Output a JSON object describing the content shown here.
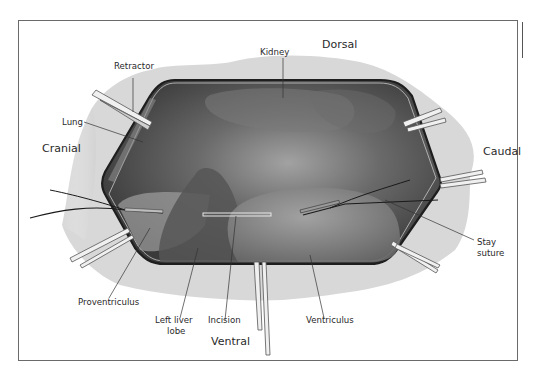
{
  "figure": {
    "type": "surgical-anatomy-diagram",
    "orientation": {
      "top": "Dorsal",
      "bottom": "Ventral",
      "left": "Cranial",
      "right": "Caudal"
    },
    "labels": {
      "retractor": "Retractor",
      "kidney": "Kidney",
      "lung": "Lung",
      "stay_suture_line1": "Stay",
      "stay_suture_line2": "suture",
      "proventriculus": "Proventriculus",
      "left_liver_lobe_line1": "Left liver",
      "left_liver_lobe_line2": "lobe",
      "incision": "Incision",
      "ventriculus": "Ventriculus"
    },
    "colors": {
      "cavity_dark": "#3c3c3c",
      "cavity_mid": "#6e6e6e",
      "organ_light": "#8c8c8c",
      "drape": "#d6d6d6",
      "outline": "#1e1e1e",
      "frame": "#6a6a6a"
    }
  }
}
